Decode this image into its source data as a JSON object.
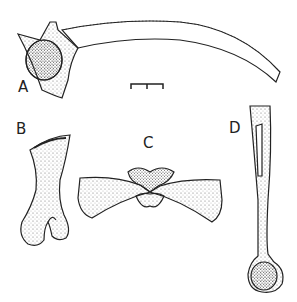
{
  "figure": {
    "panels": [
      {
        "label": "A",
        "subject": "curved long bone with articular head (lateral view)"
      },
      {
        "label": "B",
        "subject": "short bone, flared proximal end and notched distal end"
      },
      {
        "label": "C",
        "subject": "paired bones meeting at a central articulation"
      },
      {
        "label": "D",
        "subject": "long bone with rounded distal head"
      }
    ],
    "scale_bar": {
      "label": ""
    }
  }
}
